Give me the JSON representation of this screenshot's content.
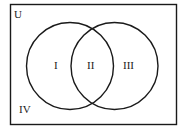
{
  "diagram": {
    "type": "venn",
    "universe_label": "U",
    "regions": [
      {
        "id": "I",
        "label": "I",
        "description": "only set A"
      },
      {
        "id": "II",
        "label": "II",
        "description": "A and B intersection"
      },
      {
        "id": "III",
        "label": "III",
        "description": "only set B"
      },
      {
        "id": "IV",
        "label": "IV",
        "description": "outside both sets"
      }
    ],
    "colors": {
      "stroke": "#1a1a1a",
      "background": "#ffffff"
    }
  }
}
